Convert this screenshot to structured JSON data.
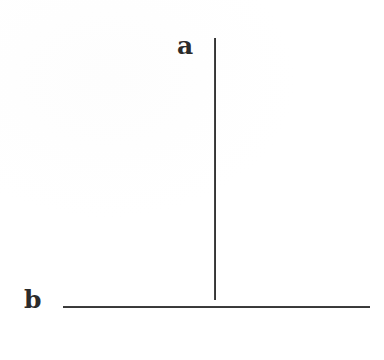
{
  "figure": {
    "caption": "",
    "background_color": "#fefefe",
    "ink_color": "#333333",
    "labels": {
      "vertical": "a",
      "horizontal": "b"
    },
    "elements": [
      {
        "name": "vertical-line",
        "label": "a",
        "orientation": "vertical",
        "x": 214,
        "y_start": 38,
        "y_end": 300,
        "length_px": 262,
        "thickness_px": 2,
        "color": "#333333"
      },
      {
        "name": "horizontal-line",
        "label": "b",
        "orientation": "horizontal",
        "y": 306,
        "x_start": 63,
        "x_end": 370,
        "length_px": 307,
        "thickness_px": 2,
        "color": "#333333"
      }
    ]
  },
  "chart_data": {
    "type": "diagram",
    "title": "",
    "xlabel": "",
    "ylabel": "",
    "categories": [
      "a",
      "b"
    ],
    "values": [
      262,
      307
    ],
    "series": [
      {
        "name": "line length (px)",
        "values": [
          262,
          307
        ]
      }
    ],
    "annotations": [
      "a",
      "b"
    ],
    "grid": false,
    "legend": "none"
  }
}
